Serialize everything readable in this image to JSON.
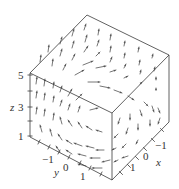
{
  "figure": {
    "type": "3d-vector-field",
    "width": 179,
    "height": 189,
    "colors": {
      "edge": "#3a3a3a",
      "arrow": "#666666",
      "label": "#333333",
      "background": "#ffffff"
    },
    "cube": {
      "vertices": {
        "top_back": [
          87,
          15
        ],
        "top_right": [
          169,
          55
        ],
        "top_left": [
          30,
          73
        ],
        "top_front": [
          112,
          113
        ],
        "bottom_left": [
          30,
          137
        ],
        "bottom_front": [
          112,
          180
        ],
        "bottom_right": [
          169,
          122
        ]
      }
    },
    "axes": {
      "z": {
        "label": "z",
        "label_pos": [
          10,
          111
        ],
        "ticks": [
          {
            "label": "5",
            "pos": [
              30,
              75
            ],
            "label_pos": [
              18,
              79
            ]
          },
          {
            "label": "",
            "pos": [
              30,
              91
            ]
          },
          {
            "label": "3",
            "pos": [
              30,
              107
            ],
            "label_pos": [
              18,
              111
            ]
          },
          {
            "label": "",
            "pos": [
              30,
              121
            ]
          },
          {
            "label": "1",
            "pos": [
              30,
              136
            ],
            "label_pos": [
              18,
              140
            ]
          }
        ]
      },
      "y": {
        "label": "y",
        "label_pos": [
          54,
          176
        ],
        "ticks": [
          {
            "label": "",
            "pos": [
              39,
              142
            ]
          },
          {
            "label": "−1",
            "pos": [
              49,
              147
            ],
            "label_pos": [
              42,
              163
            ]
          },
          {
            "label": "",
            "pos": [
              59,
              152
            ]
          },
          {
            "label": "0",
            "pos": [
              69,
              157
            ],
            "label_pos": [
              63,
              171
            ]
          },
          {
            "label": "",
            "pos": [
              80,
              163
            ]
          },
          {
            "label": "1",
            "pos": [
              90,
              168
            ],
            "label_pos": [
              80,
              180
            ]
          },
          {
            "label": "",
            "pos": [
              101,
              174
            ]
          }
        ]
      },
      "x": {
        "label": "x",
        "label_pos": [
          156,
          166
        ],
        "ticks": [
          {
            "label": "",
            "pos": [
              162,
              130
            ]
          },
          {
            "label": "−1",
            "pos": [
              153,
              140
            ],
            "label_pos": [
              155,
              149
            ]
          },
          {
            "label": "",
            "pos": [
              145,
              149
            ]
          },
          {
            "label": "0",
            "pos": [
              137,
              158
            ],
            "label_pos": [
              143,
              160
            ]
          },
          {
            "label": "",
            "pos": [
              129,
              166
            ]
          },
          {
            "label": "1",
            "pos": [
              121,
              173
            ],
            "label_pos": [
              130,
              171
            ]
          }
        ]
      }
    },
    "arrows": [
      [
        84,
        30,
        86,
        24
      ],
      [
        98,
        35,
        99,
        29
      ],
      [
        110,
        40,
        111,
        34
      ],
      [
        124,
        46,
        125,
        41
      ],
      [
        138,
        52,
        139,
        47
      ],
      [
        152,
        58,
        153,
        54
      ],
      [
        72,
        36,
        74,
        29
      ],
      [
        85,
        42,
        87,
        35
      ],
      [
        97,
        46,
        99,
        40
      ],
      [
        110,
        52,
        111,
        46
      ],
      [
        124,
        58,
        125,
        53
      ],
      [
        139,
        65,
        140,
        60
      ],
      [
        154,
        71,
        155,
        67
      ],
      [
        60,
        44,
        62,
        37
      ],
      [
        72,
        48,
        74,
        41
      ],
      [
        84,
        52,
        88,
        46
      ],
      [
        96,
        56,
        100,
        52
      ],
      [
        110,
        62,
        112,
        57
      ],
      [
        124,
        68,
        126,
        64
      ],
      [
        140,
        74,
        141,
        70
      ],
      [
        156,
        80,
        156,
        77
      ],
      [
        48,
        52,
        49,
        45
      ],
      [
        60,
        56,
        62,
        49
      ],
      [
        72,
        60,
        75,
        54
      ],
      [
        83,
        65,
        93,
        61
      ],
      [
        96,
        68,
        106,
        66
      ],
      [
        110,
        72,
        116,
        70
      ],
      [
        124,
        78,
        128,
        76
      ],
      [
        140,
        84,
        142,
        82
      ],
      [
        156,
        90,
        156,
        88
      ],
      [
        40,
        62,
        41,
        55
      ],
      [
        52,
        66,
        53,
        59
      ],
      [
        63,
        70,
        66,
        64
      ],
      [
        75,
        75,
        84,
        70
      ],
      [
        88,
        82,
        100,
        82
      ],
      [
        100,
        86,
        110,
        88
      ],
      [
        114,
        90,
        122,
        93
      ],
      [
        128,
        96,
        134,
        100
      ],
      [
        144,
        102,
        148,
        106
      ],
      [
        158,
        108,
        160,
        113
      ],
      [
        36,
        84,
        37,
        77
      ],
      [
        44,
        86,
        45,
        79
      ],
      [
        53,
        88,
        54,
        82
      ],
      [
        60,
        92,
        62,
        86
      ],
      [
        68,
        96,
        72,
        89
      ],
      [
        76,
        100,
        82,
        94
      ],
      [
        36,
        98,
        37,
        91
      ],
      [
        44,
        100,
        45,
        93
      ],
      [
        53,
        102,
        54,
        96
      ],
      [
        60,
        106,
        62,
        100
      ],
      [
        68,
        110,
        70,
        104
      ],
      [
        78,
        112,
        80,
        106
      ],
      [
        90,
        110,
        98,
        108
      ],
      [
        36,
        114,
        37,
        107
      ],
      [
        44,
        116,
        45,
        109
      ],
      [
        53,
        120,
        54,
        113
      ],
      [
        62,
        124,
        60,
        117
      ],
      [
        72,
        126,
        68,
        120
      ],
      [
        82,
        128,
        78,
        122
      ],
      [
        92,
        130,
        86,
        126
      ],
      [
        102,
        132,
        96,
        130
      ],
      [
        42,
        132,
        40,
        125
      ],
      [
        52,
        136,
        50,
        129
      ],
      [
        62,
        140,
        58,
        134
      ],
      [
        72,
        144,
        66,
        140
      ],
      [
        82,
        146,
        74,
        143
      ],
      [
        94,
        148,
        86,
        146
      ],
      [
        104,
        150,
        96,
        150
      ],
      [
        60,
        152,
        56,
        146
      ],
      [
        72,
        154,
        66,
        150
      ],
      [
        86,
        156,
        78,
        154
      ],
      [
        100,
        158,
        90,
        158
      ],
      [
        110,
        160,
        102,
        162
      ],
      [
        86,
        166,
        78,
        164
      ],
      [
        102,
        168,
        92,
        168
      ],
      [
        120,
        118,
        118,
        124
      ],
      [
        130,
        114,
        130,
        120
      ],
      [
        140,
        110,
        142,
        116
      ],
      [
        152,
        106,
        154,
        112
      ],
      [
        160,
        118,
        158,
        124
      ],
      [
        118,
        134,
        114,
        138
      ],
      [
        128,
        128,
        126,
        134
      ],
      [
        138,
        124,
        138,
        130
      ],
      [
        150,
        120,
        150,
        126
      ],
      [
        116,
        148,
        112,
        150
      ],
      [
        126,
        144,
        122,
        148
      ],
      [
        138,
        140,
        136,
        144
      ],
      [
        118,
        160,
        114,
        162
      ],
      [
        128,
        156,
        122,
        158
      ]
    ]
  }
}
